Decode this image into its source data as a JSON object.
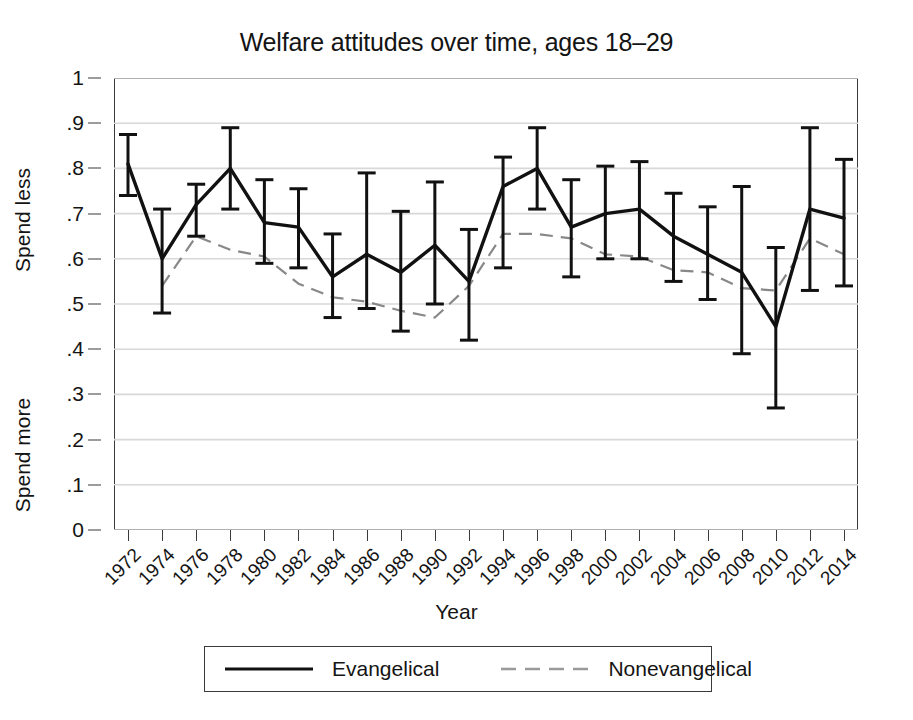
{
  "chart_data": {
    "type": "line",
    "title": "Welfare attitudes over time, ages 18–29",
    "xlabel": "Year",
    "ylabel_top": "Spend less",
    "ylabel_bottom": "Spend more",
    "ylim": [
      0,
      1
    ],
    "ytick_labels": [
      "0",
      ".1",
      ".2",
      ".3",
      ".4",
      ".5",
      ".6",
      ".7",
      ".8",
      ".9",
      "1"
    ],
    "ytick_values": [
      0,
      0.1,
      0.2,
      0.3,
      0.4,
      0.5,
      0.6,
      0.7,
      0.8,
      0.9,
      1
    ],
    "grid": true,
    "grid_axis": "y",
    "legend_position": "below-plot",
    "x": [
      1972,
      1974,
      1976,
      1978,
      1980,
      1982,
      1984,
      1986,
      1988,
      1990,
      1992,
      1994,
      1996,
      1998,
      2000,
      2002,
      2004,
      2006,
      2008,
      2010,
      2012,
      2014
    ],
    "xtick_labels": [
      "1972",
      "1974",
      "1976",
      "1978",
      "1980",
      "1982",
      "1984",
      "1986",
      "1988",
      "1990",
      "1992",
      "1994",
      "1996",
      "1998",
      "2000",
      "2002",
      "2004",
      "2006",
      "2008",
      "2010",
      "2012",
      "2014"
    ],
    "series": [
      {
        "name": "Evangelical",
        "style": "solid",
        "color": "#111111",
        "values": [
          0.81,
          0.6,
          0.72,
          0.8,
          0.68,
          0.67,
          0.56,
          0.61,
          0.57,
          0.63,
          0.55,
          0.76,
          0.8,
          0.67,
          0.7,
          0.71,
          0.65,
          0.61,
          0.57,
          0.45,
          0.71,
          0.69
        ],
        "ci_low": [
          0.74,
          0.48,
          0.65,
          0.71,
          0.59,
          0.58,
          0.47,
          0.49,
          0.44,
          0.5,
          0.42,
          0.58,
          0.71,
          0.56,
          0.6,
          0.6,
          0.55,
          0.51,
          0.39,
          0.27,
          0.53,
          0.54
        ],
        "ci_high": [
          0.875,
          0.71,
          0.765,
          0.89,
          0.775,
          0.755,
          0.655,
          0.79,
          0.705,
          0.77,
          0.665,
          0.825,
          0.89,
          0.775,
          0.805,
          0.815,
          0.745,
          0.715,
          0.76,
          0.625,
          0.89,
          0.82
        ]
      },
      {
        "name": "Nonevangelical",
        "style": "dashed",
        "color": "#888888",
        "values": [
          null,
          0.54,
          0.65,
          0.62,
          0.605,
          0.545,
          0.515,
          0.505,
          0.485,
          0.47,
          0.54,
          0.655,
          0.655,
          0.645,
          0.61,
          0.605,
          0.575,
          0.57,
          0.535,
          0.53,
          0.645,
          0.61
        ]
      }
    ]
  },
  "legend": {
    "entries": [
      {
        "label": "Evangelical",
        "style": "solid"
      },
      {
        "label": "Nonevangelical",
        "style": "dashed"
      }
    ]
  }
}
